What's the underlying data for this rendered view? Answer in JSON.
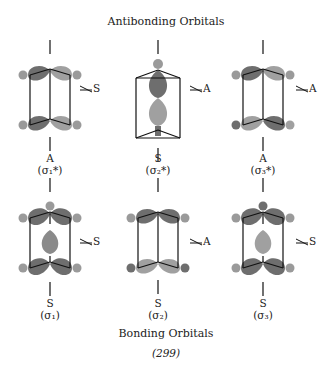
{
  "header": {
    "title": "Antibonding Orbitals"
  },
  "footer": {
    "title": "Bonding Orbitals",
    "figure_number": "(299)"
  },
  "colors": {
    "dark_lobe": "#6e6e6e",
    "light_lobe": "#a0a0a0",
    "line": "#111111"
  },
  "antibonding": [
    {
      "symmetry": "A",
      "orbital": "(σ₁*)",
      "mirror_label": "S"
    },
    {
      "symmetry": "S",
      "orbital": "(σ₂*)",
      "mirror_label": "A"
    },
    {
      "symmetry": "A",
      "orbital": "(σ₃*)",
      "mirror_label": "A"
    }
  ],
  "bonding": [
    {
      "symmetry": "S",
      "orbital": "(σ₁)",
      "mirror_label": "S"
    },
    {
      "symmetry": "S",
      "orbital": "(σ₂)",
      "mirror_label": "A"
    },
    {
      "symmetry": "S",
      "orbital": "(σ₃)",
      "mirror_label": "S"
    }
  ]
}
